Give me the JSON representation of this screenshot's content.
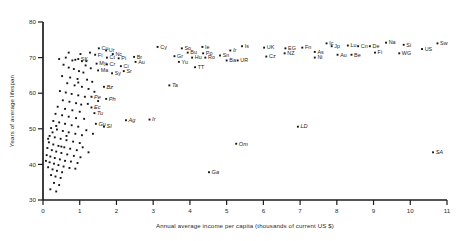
{
  "chart_data": {
    "type": "scatter",
    "title": "",
    "xlabel": "Annual average income per capita (thousands of current US $)",
    "ylabel": "Years of average lifespan",
    "xlim": [
      0,
      11
    ],
    "ylim": [
      30,
      80
    ],
    "xticks": [
      0,
      1,
      2,
      3,
      4,
      5,
      6,
      7,
      8,
      9,
      10,
      11
    ],
    "xticklabels": [
      "0",
      "1",
      "2",
      "3",
      "4",
      "5",
      "6",
      "7",
      "8",
      "9",
      "10",
      "11"
    ],
    "yticks": [
      30,
      40,
      50,
      60,
      70,
      80
    ],
    "yticklabels": [
      "30",
      "40",
      "50",
      "60",
      "70",
      "80"
    ],
    "grid": false,
    "legend": "none",
    "marker": "filled-square",
    "point_color": "#161616",
    "axis_color": "#1c1c1c",
    "labeled_points": [
      {
        "label": "Cu",
        "x": 1.52,
        "y": 72.6
      },
      {
        "label": "Ur",
        "x": 1.72,
        "y": 72.0
      },
      {
        "label": "Nc",
        "x": 1.9,
        "y": 71.0
      },
      {
        "label": "Fi",
        "x": 1.42,
        "y": 70.8
      },
      {
        "label": "Ct",
        "x": 1.74,
        "y": 70.0
      },
      {
        "label": "Pi",
        "x": 2.06,
        "y": 69.8
      },
      {
        "label": "SK",
        "x": 0.96,
        "y": 69.6
      },
      {
        "label": "Br",
        "x": 2.48,
        "y": 70.2
      },
      {
        "label": "Au",
        "x": 2.52,
        "y": 68.8
      },
      {
        "label": "My",
        "x": 1.46,
        "y": 68.3
      },
      {
        "label": "Cr",
        "x": 1.74,
        "y": 68.1
      },
      {
        "label": "Ci",
        "x": 2.12,
        "y": 67.6
      },
      {
        "label": "Ma",
        "x": 1.5,
        "y": 66.4
      },
      {
        "label": "Sy",
        "x": 1.88,
        "y": 65.6
      },
      {
        "label": "Sr",
        "x": 2.2,
        "y": 66.2
      },
      {
        "label": "Bz",
        "x": 1.66,
        "y": 61.8
      },
      {
        "label": "Pe",
        "x": 1.32,
        "y": 59.0
      },
      {
        "label": "Ph",
        "x": 1.72,
        "y": 58.4
      },
      {
        "label": "Ec",
        "x": 1.32,
        "y": 56.0
      },
      {
        "label": "Tu",
        "x": 1.4,
        "y": 54.4
      },
      {
        "label": "Gu",
        "x": 1.44,
        "y": 51.4
      },
      {
        "label": "SI",
        "x": 1.66,
        "y": 50.6
      },
      {
        "label": "Ag",
        "x": 2.26,
        "y": 52.4
      },
      {
        "label": "Ir",
        "x": 2.9,
        "y": 52.6
      },
      {
        "label": "Cy",
        "x": 3.12,
        "y": 73.0
      },
      {
        "label": "So",
        "x": 3.78,
        "y": 72.6
      },
      {
        "label": "Ie",
        "x": 4.34,
        "y": 73.0
      },
      {
        "label": "Bu",
        "x": 3.94,
        "y": 71.4
      },
      {
        "label": "Po",
        "x": 4.36,
        "y": 71.2
      },
      {
        "label": "Gr",
        "x": 3.58,
        "y": 70.4
      },
      {
        "label": "Hu",
        "x": 4.06,
        "y": 70.0
      },
      {
        "label": "Ro",
        "x": 4.42,
        "y": 70.0
      },
      {
        "label": "Yu",
        "x": 3.7,
        "y": 68.8
      },
      {
        "label": "TT",
        "x": 4.14,
        "y": 67.3
      },
      {
        "label": "Ta",
        "x": 3.44,
        "y": 62.2
      },
      {
        "label": "Sn",
        "x": 4.82,
        "y": 70.6
      },
      {
        "label": "Ir",
        "x": 5.1,
        "y": 72.0
      },
      {
        "label": "Is",
        "x": 5.42,
        "y": 73.2
      },
      {
        "label": "Ba",
        "x": 5.0,
        "y": 69.2
      },
      {
        "label": "UR",
        "x": 5.3,
        "y": 69.2
      },
      {
        "label": "UK",
        "x": 6.02,
        "y": 72.8
      },
      {
        "label": "Cz",
        "x": 6.08,
        "y": 70.3
      },
      {
        "label": "EG",
        "x": 6.6,
        "y": 72.6
      },
      {
        "label": "NZ",
        "x": 6.58,
        "y": 71.2
      },
      {
        "label": "Fn",
        "x": 7.06,
        "y": 72.8
      },
      {
        "label": "As",
        "x": 7.4,
        "y": 71.6
      },
      {
        "label": "Ic",
        "x": 7.72,
        "y": 74.0
      },
      {
        "label": "Ni",
        "x": 7.4,
        "y": 70.0
      },
      {
        "label": "Jp",
        "x": 7.86,
        "y": 73.2
      },
      {
        "label": "Au",
        "x": 8.02,
        "y": 70.8
      },
      {
        "label": "Lu",
        "x": 8.3,
        "y": 73.4
      },
      {
        "label": "Be",
        "x": 8.4,
        "y": 70.8
      },
      {
        "label": "Cn",
        "x": 8.58,
        "y": 73.2
      },
      {
        "label": "De",
        "x": 8.9,
        "y": 73.2
      },
      {
        "label": "Fi",
        "x": 9.04,
        "y": 71.4
      },
      {
        "label": "Na",
        "x": 9.34,
        "y": 74.2
      },
      {
        "label": "Si",
        "x": 9.82,
        "y": 73.6
      },
      {
        "label": "WG",
        "x": 9.7,
        "y": 71.2
      },
      {
        "label": "US",
        "x": 10.32,
        "y": 72.4
      },
      {
        "label": "Sw",
        "x": 10.74,
        "y": 74.0
      },
      {
        "label": "LD",
        "x": 6.94,
        "y": 50.6
      },
      {
        "label": "Om",
        "x": 5.26,
        "y": 45.8
      },
      {
        "label": "Ga",
        "x": 4.52,
        "y": 37.8
      },
      {
        "label": "SA",
        "x": 10.62,
        "y": 43.4
      }
    ],
    "unlabeled_points": [
      {
        "x": 0.62,
        "y": 70.0
      },
      {
        "x": 0.8,
        "y": 69.2
      },
      {
        "x": 0.88,
        "y": 69.4
      },
      {
        "x": 1.06,
        "y": 69.0
      },
      {
        "x": 1.18,
        "y": 69.0
      },
      {
        "x": 0.7,
        "y": 67.2
      },
      {
        "x": 0.84,
        "y": 66.8
      },
      {
        "x": 0.98,
        "y": 66.2
      },
      {
        "x": 1.1,
        "y": 65.8
      },
      {
        "x": 0.52,
        "y": 64.8
      },
      {
        "x": 0.74,
        "y": 64.4
      },
      {
        "x": 0.94,
        "y": 64.0
      },
      {
        "x": 1.2,
        "y": 63.8
      },
      {
        "x": 1.34,
        "y": 63.2
      },
      {
        "x": 0.66,
        "y": 62.8
      },
      {
        "x": 0.86,
        "y": 62.2
      },
      {
        "x": 1.06,
        "y": 61.8
      },
      {
        "x": 1.24,
        "y": 61.2
      },
      {
        "x": 0.46,
        "y": 60.6
      },
      {
        "x": 0.62,
        "y": 60.2
      },
      {
        "x": 0.78,
        "y": 59.8
      },
      {
        "x": 0.96,
        "y": 59.4
      },
      {
        "x": 1.14,
        "y": 59.0
      },
      {
        "x": 0.54,
        "y": 58.0
      },
      {
        "x": 0.72,
        "y": 57.6
      },
      {
        "x": 0.9,
        "y": 57.2
      },
      {
        "x": 1.04,
        "y": 56.8
      },
      {
        "x": 0.4,
        "y": 56.2
      },
      {
        "x": 0.6,
        "y": 55.6
      },
      {
        "x": 0.8,
        "y": 55.2
      },
      {
        "x": 1.0,
        "y": 54.8
      },
      {
        "x": 0.34,
        "y": 54.2
      },
      {
        "x": 0.52,
        "y": 53.8
      },
      {
        "x": 0.7,
        "y": 53.4
      },
      {
        "x": 0.9,
        "y": 53.0
      },
      {
        "x": 1.12,
        "y": 52.8
      },
      {
        "x": 0.28,
        "y": 52.2
      },
      {
        "x": 0.44,
        "y": 51.8
      },
      {
        "x": 0.6,
        "y": 51.4
      },
      {
        "x": 0.78,
        "y": 51.0
      },
      {
        "x": 0.96,
        "y": 50.6
      },
      {
        "x": 0.22,
        "y": 50.2
      },
      {
        "x": 0.38,
        "y": 49.8
      },
      {
        "x": 0.54,
        "y": 49.4
      },
      {
        "x": 0.7,
        "y": 49.0
      },
      {
        "x": 0.88,
        "y": 48.6
      },
      {
        "x": 1.06,
        "y": 48.2
      },
      {
        "x": 0.18,
        "y": 48.0
      },
      {
        "x": 0.32,
        "y": 47.6
      },
      {
        "x": 0.48,
        "y": 47.2
      },
      {
        "x": 0.64,
        "y": 46.8
      },
      {
        "x": 0.82,
        "y": 46.4
      },
      {
        "x": 1.0,
        "y": 46.0
      },
      {
        "x": 0.16,
        "y": 46.2
      },
      {
        "x": 0.28,
        "y": 45.6
      },
      {
        "x": 0.42,
        "y": 45.2
      },
      {
        "x": 0.58,
        "y": 44.8
      },
      {
        "x": 0.74,
        "y": 44.4
      },
      {
        "x": 0.92,
        "y": 44.0
      },
      {
        "x": 0.12,
        "y": 44.6
      },
      {
        "x": 0.24,
        "y": 44.0
      },
      {
        "x": 0.36,
        "y": 43.6
      },
      {
        "x": 0.5,
        "y": 43.2
      },
      {
        "x": 0.66,
        "y": 42.8
      },
      {
        "x": 0.84,
        "y": 42.4
      },
      {
        "x": 1.02,
        "y": 42.0
      },
      {
        "x": 0.1,
        "y": 42.6
      },
      {
        "x": 0.2,
        "y": 42.2
      },
      {
        "x": 0.32,
        "y": 41.8
      },
      {
        "x": 0.46,
        "y": 41.4
      },
      {
        "x": 0.6,
        "y": 41.0
      },
      {
        "x": 0.76,
        "y": 40.8
      },
      {
        "x": 0.94,
        "y": 40.4
      },
      {
        "x": 0.08,
        "y": 41.0
      },
      {
        "x": 0.18,
        "y": 40.6
      },
      {
        "x": 0.3,
        "y": 40.2
      },
      {
        "x": 0.42,
        "y": 39.8
      },
      {
        "x": 0.56,
        "y": 39.4
      },
      {
        "x": 0.72,
        "y": 39.0
      },
      {
        "x": 0.88,
        "y": 38.8
      },
      {
        "x": 0.14,
        "y": 39.2
      },
      {
        "x": 0.26,
        "y": 38.6
      },
      {
        "x": 0.38,
        "y": 38.2
      },
      {
        "x": 0.52,
        "y": 37.8
      },
      {
        "x": 0.22,
        "y": 37.0
      },
      {
        "x": 0.34,
        "y": 36.6
      },
      {
        "x": 0.48,
        "y": 36.2
      },
      {
        "x": 0.3,
        "y": 34.8
      },
      {
        "x": 0.44,
        "y": 34.2
      },
      {
        "x": 0.2,
        "y": 33.0
      },
      {
        "x": 0.36,
        "y": 32.4
      },
      {
        "x": 1.3,
        "y": 67.0
      },
      {
        "x": 1.28,
        "y": 71.4
      },
      {
        "x": 1.02,
        "y": 71.0
      },
      {
        "x": 1.16,
        "y": 67.8
      },
      {
        "x": 0.56,
        "y": 68.0
      },
      {
        "x": 0.44,
        "y": 69.6
      },
      {
        "x": 1.4,
        "y": 60.4
      },
      {
        "x": 1.5,
        "y": 57.8
      },
      {
        "x": 0.96,
        "y": 63.0
      },
      {
        "x": 1.22,
        "y": 57.0
      },
      {
        "x": 1.36,
        "y": 48.6
      },
      {
        "x": 1.18,
        "y": 49.6
      },
      {
        "x": 0.7,
        "y": 71.4
      },
      {
        "x": 0.36,
        "y": 50.8
      },
      {
        "x": 0.26,
        "y": 49.0
      },
      {
        "x": 0.14,
        "y": 47.2
      },
      {
        "x": 1.08,
        "y": 44.8
      },
      {
        "x": 1.24,
        "y": 43.4
      },
      {
        "x": 0.64,
        "y": 48.0
      },
      {
        "x": 0.5,
        "y": 45.0
      }
    ]
  }
}
